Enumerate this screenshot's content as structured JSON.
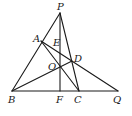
{
  "diagram": {
    "type": "geometry-figure",
    "points": {
      "P": {
        "label": "P",
        "x": 60,
        "y": 13
      },
      "A": {
        "label": "A",
        "x": 41,
        "y": 41
      },
      "E": {
        "label": "E",
        "x": 60,
        "y": 46
      },
      "D": {
        "label": "D",
        "x": 72,
        "y": 61
      },
      "O": {
        "label": "O",
        "x": 60,
        "y": 66
      },
      "B": {
        "label": "B",
        "x": 12,
        "y": 91
      },
      "F": {
        "label": "F",
        "x": 60,
        "y": 91
      },
      "C": {
        "label": "C",
        "x": 79,
        "y": 91
      },
      "Q": {
        "label": "Q",
        "x": 118,
        "y": 91
      }
    },
    "segments": [
      [
        "P",
        "B"
      ],
      [
        "P",
        "F"
      ],
      [
        "P",
        "C"
      ],
      [
        "A",
        "C"
      ],
      [
        "A",
        "Q"
      ],
      [
        "B",
        "D"
      ],
      [
        "B",
        "Q"
      ]
    ],
    "stroke_color": "#1a1a1a",
    "background": "#ffffff"
  }
}
